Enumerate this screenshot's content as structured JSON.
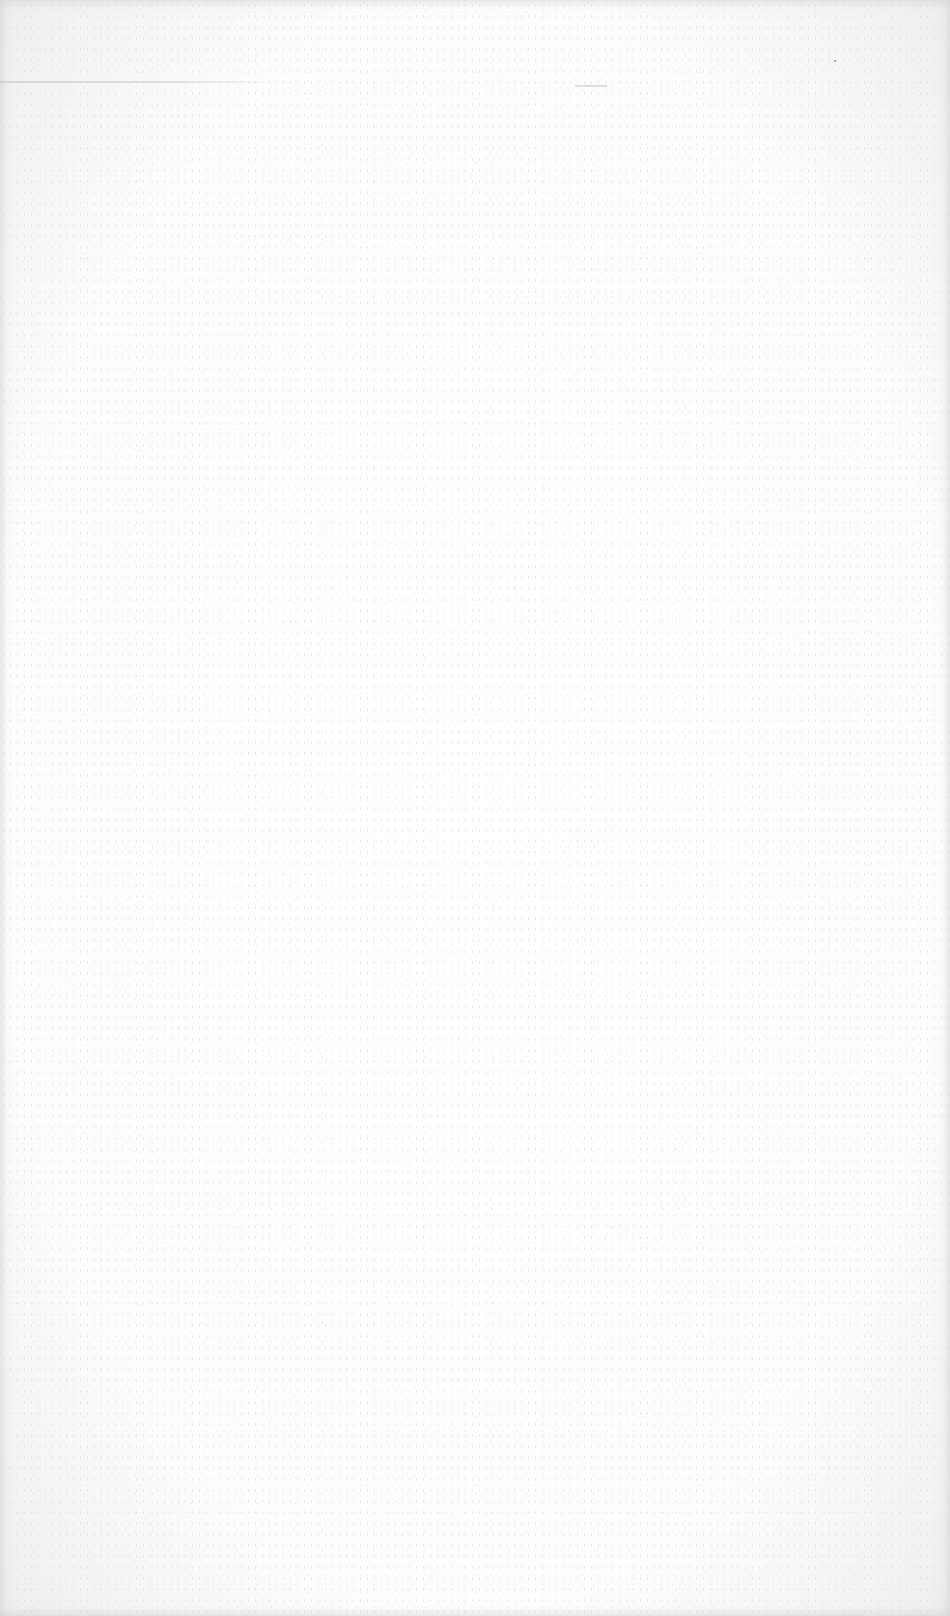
{
  "page": {
    "background_color": "#fbfbfb",
    "rule_color": "#d4d6d6"
  }
}
